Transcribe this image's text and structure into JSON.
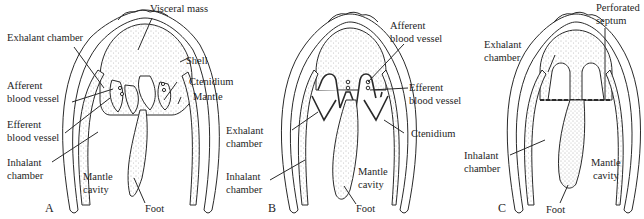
{
  "figure": {
    "cut_off_top_text": "(front matter cut off)",
    "panels": [
      {
        "id": "A",
        "letter": "A",
        "labels": {
          "visceral_mass": "Visceral mass",
          "exhalant_chamber": "Exhalant chamber",
          "shell": "Shell",
          "ctenidium": "Ctenidium",
          "afferent_1": "Afferent",
          "afferent_2": "blood vessel",
          "mantle": "Mantle",
          "efferent_1": "Efferent",
          "efferent_2": "blood vessel",
          "inhalant_1": "Inhalant",
          "inhalant_2": "chamber",
          "mantle_cavity_1": "Mantle",
          "mantle_cavity_2": "cavity",
          "foot": "Foot"
        }
      },
      {
        "id": "B",
        "letter": "B",
        "labels": {
          "afferent_1": "Afferent",
          "afferent_2": "blood vessel",
          "efferent_1": "Efferent",
          "efferent_2": "blood vessel",
          "exhalant_1": "Exhalant",
          "exhalant_2": "chamber",
          "ctenidium": "Ctenidium",
          "inhalant_1": "Inhalant",
          "inhalant_2": "chamber",
          "mantle_cavity_1": "Mantle",
          "mantle_cavity_2": "cavity",
          "foot": "Foot"
        }
      },
      {
        "id": "C",
        "letter": "C",
        "labels": {
          "perforated_1": "Perforated",
          "perforated_2": "septum",
          "exhalant_1": "Exhalant",
          "exhalant_2": "chamber",
          "inhalant_1": "Inhalant",
          "inhalant_2": "chamber",
          "mantle_cavity_1": "Mantle",
          "mantle_cavity_2": "cavity",
          "foot": "Foot"
        }
      }
    ],
    "colors": {
      "line": "#2a2a2a",
      "stipple": "#8a8a8a",
      "background": "#ffffff"
    }
  }
}
